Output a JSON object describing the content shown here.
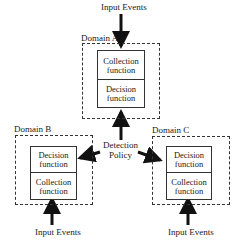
{
  "diagram": {
    "domains": [
      {
        "id": "A",
        "label": "Domain A",
        "top_function": "Collection function",
        "bottom_function": "Decision function",
        "input_label": "Input Events"
      },
      {
        "id": "B",
        "label": "Domain B",
        "top_function": "Decision function",
        "bottom_function": "Collection function",
        "input_label": "Input Events"
      },
      {
        "id": "C",
        "label": "Domain C",
        "top_function": "Decision function",
        "bottom_function": "Collection function",
        "input_label": "Input Events"
      }
    ],
    "center_label_line1": "Detection",
    "center_label_line2": "Policy",
    "colors": {
      "stroke": "#333333",
      "text": "#1a1a1a",
      "background": "#ffffff"
    }
  }
}
